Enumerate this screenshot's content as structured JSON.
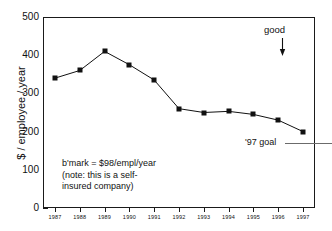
{
  "chart_data": {
    "type": "line",
    "title": "",
    "xlabel": "",
    "ylabel": "$ / employee / year",
    "categories": [
      "1987",
      "1988",
      "1989",
      "1990",
      "1991",
      "1992",
      "1993",
      "1994",
      "1995",
      "1996",
      "1997"
    ],
    "values": [
      340,
      360,
      410,
      375,
      335,
      260,
      250,
      253,
      245,
      230,
      200
    ],
    "series": [
      {
        "name": "cost per employee",
        "values": [
          340,
          360,
          410,
          375,
          335,
          260,
          250,
          253,
          245,
          230,
          200
        ]
      }
    ],
    "ylim": [
      0,
      500
    ],
    "y_ticks": [
      0,
      100,
      200,
      300,
      400,
      500
    ],
    "y_tick_labels": [
      "0",
      "100",
      "200",
      "300",
      "400",
      "500"
    ],
    "y_minor_ticks": [
      50,
      150,
      250,
      350,
      450
    ],
    "grid": false,
    "legend": "none",
    "marker": "filled-square",
    "line_color": "#111111",
    "marker_color": "#111111",
    "background_color": "#ffffff",
    "annotations": [
      {
        "id": "good",
        "text": "good",
        "kind": "label-with-down-arrow",
        "x": "1996",
        "y_top": 470,
        "y_bottom": 405
      },
      {
        "id": "goal",
        "text": "'97 goal",
        "kind": "reference-line-label",
        "value": 170,
        "line_color": "#6b6b6b"
      },
      {
        "id": "benchmark-note",
        "kind": "text-block",
        "lines": [
          "b'mark = $98/empl/year",
          "(note: this is a self-",
          "insured company)"
        ]
      }
    ]
  },
  "annotations": {
    "good_label": "good",
    "goal_label": "'97 goal",
    "note_line_1": "b'mark = $98/empl/year",
    "note_line_2": "(note: this is a self-",
    "note_line_3": "insured company)"
  },
  "axes": {
    "y_title": "$ / employee / year"
  }
}
